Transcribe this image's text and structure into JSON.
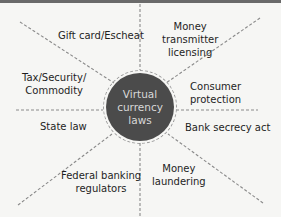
{
  "diagram": {
    "center": {
      "lines": [
        "Virtual",
        "currency",
        "laws"
      ],
      "fill_color": "#4b4b4b",
      "text_color": "#d8d8d8"
    },
    "spokes": [
      {
        "id": "gift-card",
        "lines": [
          "Gift card/Escheat"
        ]
      },
      {
        "id": "money-transmitter",
        "lines": [
          "Money",
          "transmitter",
          "licensing"
        ]
      },
      {
        "id": "tax-security",
        "lines": [
          "Tax/Security/",
          "Commodity"
        ]
      },
      {
        "id": "consumer-protection",
        "lines": [
          "Consumer",
          "protection"
        ]
      },
      {
        "id": "state-law",
        "lines": [
          "State law"
        ]
      },
      {
        "id": "bank-secrecy",
        "lines": [
          "Bank secrecy act"
        ]
      },
      {
        "id": "federal-banking",
        "lines": [
          "Federal banking",
          "regulators"
        ]
      },
      {
        "id": "money-laundering",
        "lines": [
          "Money",
          "laundering"
        ]
      }
    ],
    "line_color": "#8a8a8a",
    "border_color": "#6a6a6a"
  }
}
